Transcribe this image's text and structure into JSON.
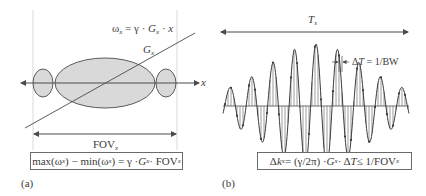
{
  "panel_a": {
    "label": "(a)",
    "omega_eq": {
      "lhs": "ω",
      "lhs_sub": "x",
      "rhs1": " = γ · ",
      "g": "G",
      "g_sub": "x",
      "rhs2": " · ",
      "x": "x"
    },
    "gradient_label": {
      "g": "G",
      "sub": "x"
    },
    "axis_label": "x",
    "fov_label": {
      "text": "FOV",
      "sub": "x"
    },
    "formula_box": {
      "p1": "max(ω",
      "s1": "x",
      "p2": ") − min(ω",
      "s2": "x",
      "p3": ") = γ · ",
      "g": "G",
      "s3": "x",
      "p4": " · FOV",
      "s4": "x"
    }
  },
  "panel_b": {
    "label": "(b)",
    "ts_label": {
      "t": "T",
      "sub": "s"
    },
    "dt_label": {
      "p1": "Δ",
      "t": "T",
      "p2": " = 1/BW"
    },
    "formula_box": {
      "p1": "Δ",
      "k": "k",
      "s1": "x",
      "p2": " = (γ/2π) · ",
      "g": "G",
      "s2": "x",
      "p3": " · Δ",
      "t": "T",
      "p4": " ≤ 1/FOV",
      "s3": "x"
    }
  },
  "colors": {
    "stroke": "#4a4a4a",
    "fill": "#d9d9d9",
    "guide": "#c8c8c8"
  }
}
